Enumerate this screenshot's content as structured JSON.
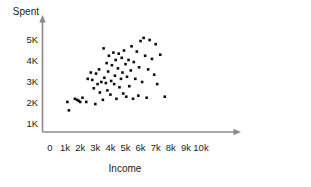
{
  "chart_data": {
    "type": "scatter",
    "title": "",
    "xlabel": "Income",
    "ylabel": "Spent",
    "xticklabels": [
      "0",
      "1k",
      "2k",
      "3k",
      "4k",
      "5k",
      "6k",
      "7k",
      "8k",
      "9k",
      "10k"
    ],
    "xtickvalues": [
      0,
      1000,
      2000,
      3000,
      4000,
      5000,
      6000,
      7000,
      8000,
      9000,
      10000
    ],
    "yticklabels": [
      "1K",
      "2K",
      "3K",
      "4K",
      "5K"
    ],
    "ytickvalues": [
      1000,
      2000,
      3000,
      4000,
      5000
    ],
    "xlim": [
      0,
      10000
    ],
    "ylim": [
      500,
      5800
    ],
    "grid": false,
    "legend": null,
    "marker": "filled-square",
    "marker_color": "#0d0d0d",
    "points": [
      {
        "x": 1150,
        "y": 2050
      },
      {
        "x": 1250,
        "y": 1650
      },
      {
        "x": 1650,
        "y": 2200
      },
      {
        "x": 1800,
        "y": 2150
      },
      {
        "x": 1900,
        "y": 2100
      },
      {
        "x": 2000,
        "y": 2050
      },
      {
        "x": 2150,
        "y": 2250
      },
      {
        "x": 2400,
        "y": 2050
      },
      {
        "x": 2500,
        "y": 3150
      },
      {
        "x": 2700,
        "y": 3450
      },
      {
        "x": 2800,
        "y": 3100
      },
      {
        "x": 2900,
        "y": 2700
      },
      {
        "x": 3000,
        "y": 1950
      },
      {
        "x": 3050,
        "y": 3400
      },
      {
        "x": 3150,
        "y": 2900
      },
      {
        "x": 3250,
        "y": 3600
      },
      {
        "x": 3300,
        "y": 2500
      },
      {
        "x": 3400,
        "y": 3000
      },
      {
        "x": 3500,
        "y": 2150
      },
      {
        "x": 3550,
        "y": 4600
      },
      {
        "x": 3600,
        "y": 3200
      },
      {
        "x": 3700,
        "y": 2950
      },
      {
        "x": 3750,
        "y": 3900
      },
      {
        "x": 3800,
        "y": 2600
      },
      {
        "x": 3850,
        "y": 3500
      },
      {
        "x": 3900,
        "y": 4250
      },
      {
        "x": 4000,
        "y": 2400
      },
      {
        "x": 4050,
        "y": 3050
      },
      {
        "x": 4100,
        "y": 3800
      },
      {
        "x": 4200,
        "y": 4400
      },
      {
        "x": 4250,
        "y": 2900
      },
      {
        "x": 4300,
        "y": 3300
      },
      {
        "x": 4350,
        "y": 4050
      },
      {
        "x": 4400,
        "y": 2200
      },
      {
        "x": 4500,
        "y": 3650
      },
      {
        "x": 4550,
        "y": 4350
      },
      {
        "x": 4600,
        "y": 2750
      },
      {
        "x": 4700,
        "y": 3150
      },
      {
        "x": 4750,
        "y": 4150
      },
      {
        "x": 4800,
        "y": 3450
      },
      {
        "x": 4850,
        "y": 2450
      },
      {
        "x": 4900,
        "y": 4500
      },
      {
        "x": 5000,
        "y": 3850
      },
      {
        "x": 5050,
        "y": 2300
      },
      {
        "x": 5100,
        "y": 3250
      },
      {
        "x": 5200,
        "y": 4050
      },
      {
        "x": 5250,
        "y": 2800
      },
      {
        "x": 5350,
        "y": 3550
      },
      {
        "x": 5400,
        "y": 4700
      },
      {
        "x": 5500,
        "y": 2200
      },
      {
        "x": 5550,
        "y": 3950
      },
      {
        "x": 5650,
        "y": 3150
      },
      {
        "x": 5750,
        "y": 4450
      },
      {
        "x": 5850,
        "y": 2350
      },
      {
        "x": 5900,
        "y": 3700
      },
      {
        "x": 6000,
        "y": 4950
      },
      {
        "x": 6100,
        "y": 3000
      },
      {
        "x": 6200,
        "y": 5100
      },
      {
        "x": 6300,
        "y": 4250
      },
      {
        "x": 6400,
        "y": 2250
      },
      {
        "x": 6500,
        "y": 3600
      },
      {
        "x": 6600,
        "y": 5000
      },
      {
        "x": 6750,
        "y": 4100
      },
      {
        "x": 6900,
        "y": 3350
      },
      {
        "x": 7000,
        "y": 4800
      },
      {
        "x": 7100,
        "y": 2900
      },
      {
        "x": 7300,
        "y": 4300
      },
      {
        "x": 7600,
        "y": 2300
      }
    ]
  }
}
